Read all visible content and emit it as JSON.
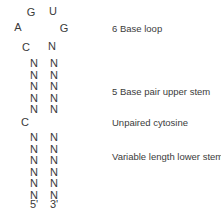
{
  "diagram": {
    "loop": {
      "bases": [
        {
          "residue": "G",
          "x": 25,
          "y": 7
        },
        {
          "residue": "U",
          "x": 47,
          "y": 6
        },
        {
          "residue": "A",
          "x": 12,
          "y": 22
        },
        {
          "residue": "G",
          "x": 58,
          "y": 23
        },
        {
          "residue": "C",
          "x": 20,
          "y": 42
        },
        {
          "residue": "N",
          "x": 46,
          "y": 41
        }
      ]
    },
    "upper_stem": {
      "pair_count": 5,
      "left_x": 28,
      "right_x": 48,
      "start_y": 58,
      "row_spacing": 11.5,
      "pairs": [
        {
          "left": "N",
          "right": "N"
        },
        {
          "left": "N",
          "right": "N"
        },
        {
          "left": "N",
          "right": "N"
        },
        {
          "left": "N",
          "right": "N"
        },
        {
          "left": "N",
          "right": "N"
        }
      ]
    },
    "unpaired": {
      "residue": "C",
      "x": 19,
      "y": 117
    },
    "lower_stem": {
      "pair_count": 6,
      "left_x": 28,
      "right_x": 48,
      "start_y": 132,
      "row_spacing": 11.5,
      "pairs": [
        {
          "left": "N",
          "right": "N"
        },
        {
          "left": "N",
          "right": "N"
        },
        {
          "left": "N",
          "right": "N"
        },
        {
          "left": "N",
          "right": "N"
        },
        {
          "left": "N",
          "right": "N"
        },
        {
          "left": "N",
          "right": "N"
        }
      ]
    },
    "termini": {
      "five_prime": {
        "label": "5'",
        "x": 28,
        "y": 199
      },
      "three_prime": {
        "label": "3'",
        "x": 48,
        "y": 199
      }
    },
    "annotations": [
      {
        "text": "6 Base loop",
        "x": 112,
        "y": 23
      },
      {
        "text": "5 Base pair upper stem",
        "x": 112,
        "y": 86
      },
      {
        "text": "Unpaired cytosine",
        "x": 112,
        "y": 117
      },
      {
        "text": "Variable length lower stem",
        "x": 112,
        "y": 151
      }
    ]
  }
}
